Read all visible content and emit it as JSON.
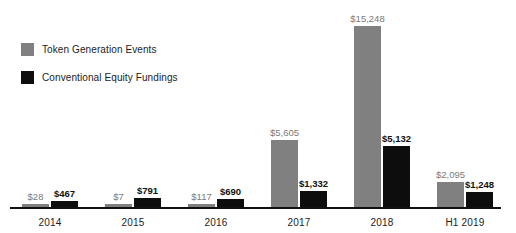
{
  "chart_data": {
    "type": "bar",
    "title": "",
    "subtitle": "",
    "xlabel": "",
    "ylabel": "",
    "ylim": [
      0,
      15248
    ],
    "grid": false,
    "legend_position": "top-left",
    "categories": [
      "2014",
      "2015",
      "2016",
      "2017",
      "2018",
      "H1 2019"
    ],
    "series": [
      {
        "name": "Token Generation Events",
        "color": "#808080",
        "values": [
          28,
          7,
          117,
          5605,
          15248,
          2095
        ],
        "labels": [
          "$28",
          "$7",
          "$117",
          "$5,605",
          "$15,248",
          "$2,095"
        ]
      },
      {
        "name": "Conventional Equity Fundings",
        "color": "#0d0d0d",
        "values": [
          467,
          791,
          690,
          1332,
          5132,
          1248
        ],
        "labels": [
          "$467",
          "$791",
          "$690",
          "$1,332",
          "$5,132",
          "$1,248"
        ]
      }
    ]
  },
  "legend": {
    "items": [
      {
        "label": "Token Generation Events",
        "color": "#808080"
      },
      {
        "label": "Conventional Equity Fundings",
        "color": "#0d0d0d"
      }
    ]
  },
  "axis": {
    "baseline_color": "#111111"
  }
}
